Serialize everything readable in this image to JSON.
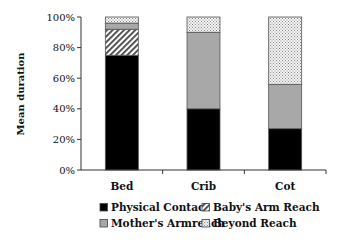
{
  "chart_data": {
    "type": "bar",
    "stacked": true,
    "orientation": "vertical",
    "title": "",
    "xlabel": "",
    "ylabel": "Mean duration",
    "ylim": [
      0,
      100
    ],
    "yticks": [
      "0%",
      "20%",
      "40%",
      "60%",
      "80%",
      "100%"
    ],
    "categories": [
      "Bed",
      "Crib",
      "Cot"
    ],
    "series": [
      {
        "name": "Physical Contact",
        "pattern": "solid-black",
        "values": [
          75,
          40,
          27
        ]
      },
      {
        "name": "Baby's Arm Reach",
        "pattern": "diagonal-hatch",
        "values": [
          17,
          0,
          0
        ]
      },
      {
        "name": "Mother's Armreach",
        "pattern": "solid-gray",
        "values": [
          4,
          50,
          29
        ]
      },
      {
        "name": "Beyond Reach",
        "pattern": "dotted",
        "values": [
          4,
          10,
          44
        ]
      }
    ],
    "grid": false,
    "legend_position": "bottom",
    "legend": [
      {
        "label": "Physical Contact",
        "pattern": "solid-black"
      },
      {
        "label": "Baby's Arm Reach",
        "pattern": "diagonal-hatch"
      },
      {
        "label": "Mother's Armreach",
        "pattern": "solid-gray"
      },
      {
        "label": "Beyond Reach",
        "pattern": "dotted"
      }
    ]
  },
  "colors": {
    "black": "#000000",
    "gray": "#a8a8a8",
    "hatch_fg": "#444444",
    "dot_fg": "#888888",
    "axis": "#333333"
  }
}
